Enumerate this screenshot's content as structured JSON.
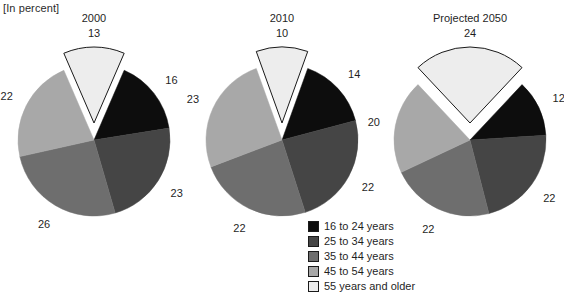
{
  "units_note": "[In percent]",
  "legend": {
    "position": "bottom-center",
    "items": [
      {
        "label": "16 to 24 years",
        "color": "#0d0d0d"
      },
      {
        "label": "25 to 34 years",
        "color": "#454545"
      },
      {
        "label": "35 to 44 years",
        "color": "#6e6e6e"
      },
      {
        "label": "45 to 54 years",
        "color": "#a8a8a8"
      },
      {
        "label": "55 years and older",
        "color": "#ededed"
      }
    ]
  },
  "chart_data": [
    {
      "type": "pie",
      "title": "2000",
      "xlabel": "",
      "ylabel": "",
      "unit": "percent",
      "exploded_slice": "55 years and older",
      "categories": [
        "55 years and older",
        "16 to 24 years",
        "25 to 34 years",
        "35 to 44 years",
        "45 to 54 years"
      ],
      "values": [
        13,
        16,
        23,
        26,
        22
      ],
      "colors": [
        "#ededed",
        "#0d0d0d",
        "#454545",
        "#6e6e6e",
        "#a8a8a8"
      ],
      "labels": {
        "top": "13",
        "right_upper": "16",
        "right_lower": "23",
        "bottom_left": "26",
        "left": "22"
      }
    },
    {
      "type": "pie",
      "title": "2010",
      "xlabel": "",
      "ylabel": "",
      "unit": "percent",
      "exploded_slice": "55 years and older",
      "categories": [
        "55 years and older",
        "16 to 24 years",
        "25 to 34 years",
        "35 to 44 years",
        "45 to 54 years"
      ],
      "values": [
        10,
        14,
        22,
        22,
        23
      ],
      "colors": [
        "#ededed",
        "#0d0d0d",
        "#454545",
        "#6e6e6e",
        "#a8a8a8"
      ],
      "labels": {
        "top": "10",
        "right_upper": "14",
        "right_lower": "22",
        "bottom_left": "22",
        "left": "23"
      }
    },
    {
      "type": "pie",
      "title": "Projected 2050",
      "xlabel": "",
      "ylabel": "",
      "unit": "percent",
      "exploded_slice": "55 years and older",
      "categories": [
        "55 years and older",
        "16 to 24 years",
        "25 to 34 years",
        "35 to 44 years",
        "45 to 54 years"
      ],
      "values": [
        24,
        12,
        22,
        22,
        20
      ],
      "colors": [
        "#ededed",
        "#0d0d0d",
        "#454545",
        "#6e6e6e",
        "#a8a8a8"
      ],
      "labels": {
        "top": "24",
        "right_upper": "12",
        "right_lower": "22",
        "bottom_left": "22",
        "left": "20"
      }
    }
  ]
}
